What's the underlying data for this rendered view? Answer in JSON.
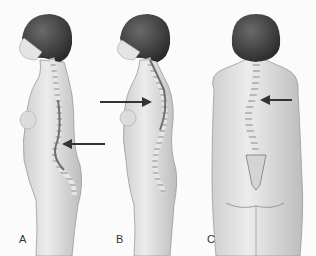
{
  "figure": {
    "panels": [
      {
        "label": "A",
        "view": "side",
        "arrow_target": "lower back (lumbar curve)"
      },
      {
        "label": "B",
        "view": "side",
        "arrow_target": "upper back (thoracic curve)"
      },
      {
        "label": "C",
        "view": "back",
        "arrow_target": "mid back (lateral curve)"
      }
    ],
    "colors": {
      "background": "#fbfbfb",
      "skin": "#e2e2e2",
      "skin_shadow": "#c4c4c4",
      "hair": "#3c3c3c",
      "spine": "#d8d8d8",
      "spine_canal": "#6e6e6e",
      "arrow": "#333333",
      "label": "#333333"
    }
  }
}
